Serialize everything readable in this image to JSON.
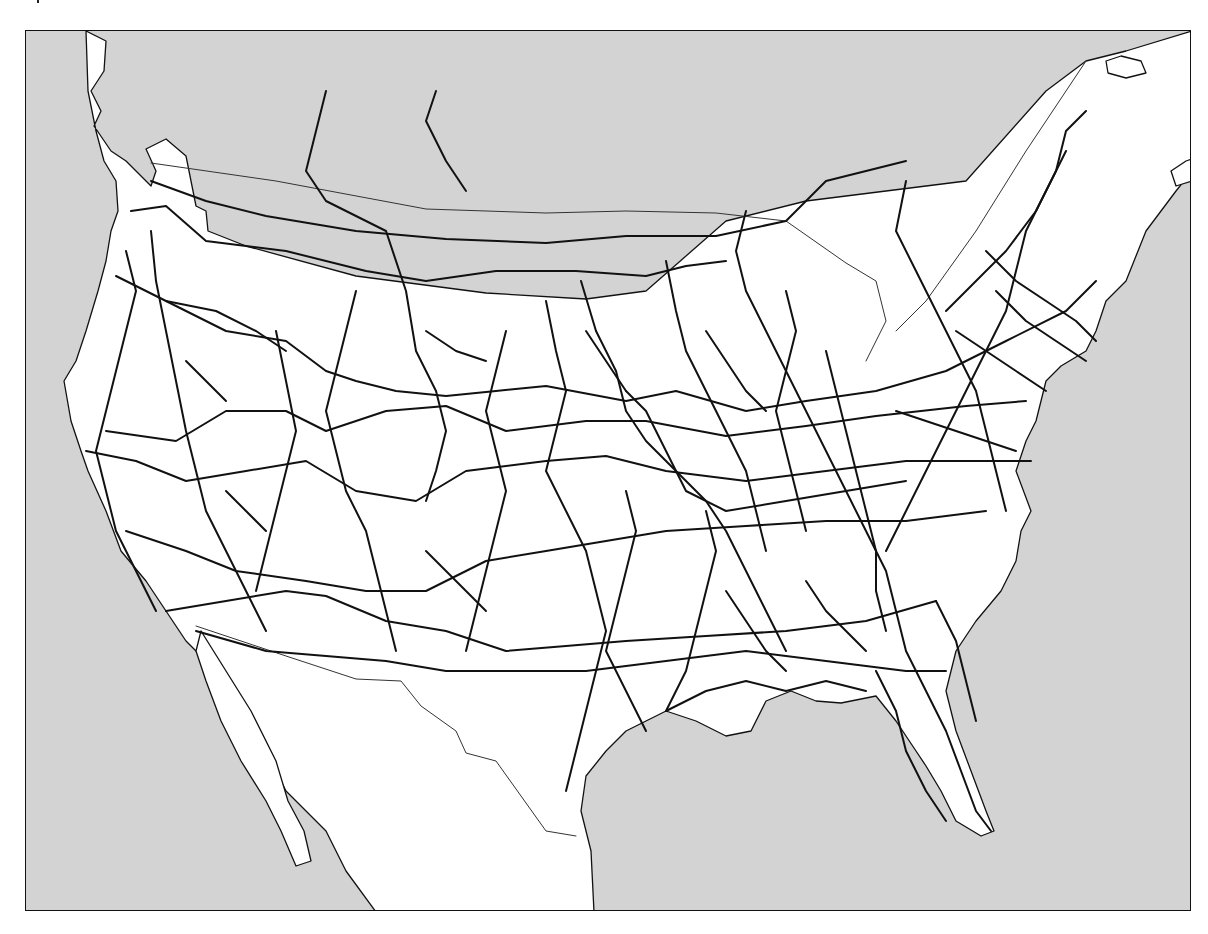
{
  "map": {
    "title": "",
    "colors": {
      "ocean": "#d3d3d3",
      "land": "#ffffff",
      "coastline": "#111111",
      "rail": "#111111",
      "border": "#333333",
      "frame": "#111111"
    },
    "stroke": {
      "coast": 1.3,
      "rail": 2.0,
      "border": 1.0
    },
    "land_paths": [
      "M60 0 L80 10 L78 40 L65 60 L75 80 L68 95 L85 120 L100 130 L125 155 L130 140 L120 118 L140 108 L160 125 L165 150 L170 175 L180 180 L182 200 L220 215 L330 245 L460 262 L560 268 L620 260 L700 190 L780 170 L860 160 L940 150 L1020 60 L1060 30 L1100 20 L1166 0 L1166 140 L1150 160 L1120 200 L1100 250 L1080 270 L1070 300 L1060 320 L1035 335 L1020 350 L1010 390 L1000 410 L990 440 L1005 480 L995 500 L990 530 L975 560 L950 590 L930 620 L920 660 L930 700 L945 740 L960 780 L968 800 L955 805 L930 790 L915 760 L900 735 L890 720 L870 690 L850 665 L815 672 L790 670 L765 660 L740 670 L725 700 L700 705 L670 690 L640 680 L620 690 L600 700 L580 720 L560 745 L555 780 L565 820 L568 881 L350 881 L320 840 L300 800 L260 760 L230 700 L210 670 L190 640 L160 610 L140 580 L120 550 L95 520 L80 480 L62 440 L55 420 L45 390 L38 350 L50 330 L60 300 L72 260 L80 230 L85 200 L92 180 L90 150 L78 130 L70 100 L62 60 Z",
      "M175 600 L200 640 L225 680 L250 730 L262 770 L278 800 L285 830 L270 835 L255 800 L240 770 L215 730 L195 690 L180 650 L170 620 Z"
    ],
    "island_paths": [
      "M1080 30 L1095 25 L1115 30 L1120 42 L1100 47 L1082 42 Z",
      "M1160 130 L1166 128 L1166 150 L1150 155 L1145 140 Z"
    ],
    "border_paths": [
      "M125 132 L250 150 L400 178 L520 182 L600 180 L690 182 L760 190 L820 232 L850 250 L860 290 L840 330",
      "M170 595 L260 625 L330 648 L375 650 L395 675 L430 700 L440 722 L470 730 L520 800 L550 805",
      "M1060 30 L1000 120 L950 200 L900 270 L870 300"
    ],
    "rail_paths": [
      "M125 150 L180 170 L240 185 L330 200 L420 208 L520 212 L600 205 L690 205 L760 190 L800 150 L880 130",
      "M105 180 L140 175 L180 210 L260 220 L340 240 L400 250 L470 240 L550 240 L620 245 L660 235 L700 230",
      "M90 245 L150 275 L200 300 L260 310 L300 340 L330 350 L370 360 L420 365 L470 360 L520 355 L600 370 L650 360 L720 380 L780 370 L850 360 L920 340 L980 310 L1040 280 L1070 250",
      "M80 400 L150 410 L200 380 L260 380 L300 400 L360 380 L420 375 L480 400 L560 390 L620 390 L700 405 L780 395 L850 385 L940 375 L1000 370",
      "M60 420 L110 430 L160 450 L220 440 L280 430 L330 460 L390 470 L440 440 L520 430 L580 425 L640 440 L720 450 L800 440 L880 430 L960 430 L1005 430",
      "M100 500 L160 520 L210 540 L280 550 L340 560 L400 560 L460 530 L520 520 L580 510 L640 500 L720 495 L800 490 L880 490 L960 480",
      "M140 580 L200 570 L260 560 L300 565 L360 590 L420 600 L480 620 L540 615 L600 610 L680 605 L760 600 L840 590 L910 570",
      "M170 600 L240 620 L300 625 L360 630 L420 640 L480 640 L560 640 L640 630 L720 620 L800 630 L880 640 L920 640",
      "M300 60 L290 100 L280 140 L300 170 L360 200 L380 260 L390 320 L410 360 L420 400 L410 440 L400 470",
      "M410 60 L400 90 L420 130 L440 160",
      "M555 250 L570 300 L590 340 L600 380 L620 410 L650 440 L680 470 L700 500 L720 540 L740 580 L760 620",
      "M640 230 L650 280 L660 320 L680 360 L700 400 L720 440 L730 480 L740 520",
      "M720 180 L710 220 L720 260 L740 300 L760 340 L780 380 L800 420 L820 460 L840 500 L860 540 L870 580 L880 620 L900 660 L920 700 L935 740 L950 780 L965 800",
      "M880 150 L870 200 L890 240 L910 280 L930 320 L950 360 L960 400 L970 440 L980 480",
      "M1040 120 L1020 160 L1000 200 L990 240 L980 280 L960 320 L940 360 L920 400 L900 440 L880 480 L860 520",
      "M1060 80 L1040 100 L1030 140 L1010 180 L980 220 L950 250 L920 280",
      "M100 220 L110 260 L100 300 L90 340 L80 380 L70 420 L80 460 L90 500 L110 540 L130 580",
      "M125 200 L130 250 L140 300 L150 350 L160 400 L170 440 L180 480 L200 520 L220 560 L240 600",
      "M250 300 L260 350 L270 400 L260 440 L250 480 L240 520 L230 560",
      "M330 260 L320 300 L310 340 L300 380 L310 420 L320 460 L340 500 L350 540 L360 580 L370 620",
      "M480 300 L470 340 L460 380 L470 420 L480 460 L470 500 L460 540 L450 580 L440 620",
      "M520 270 L530 320 L540 360 L530 400 L520 440 L540 480 L560 520 L570 560 L580 600 L570 640 L560 680 L550 720 L540 760",
      "M600 460 L610 500 L600 540 L590 580 L580 620 L600 660 L620 700",
      "M680 480 L690 520 L680 560 L670 600 L660 640 L640 680",
      "M800 320 L810 360 L820 400 L830 440 L840 480 L850 520 L850 560 L860 600",
      "M760 260 L770 300 L760 340 L750 380 L760 420 L770 460 L780 500",
      "M600 360 L620 380 L640 420 L660 460 L700 480 L760 470 L820 460 L880 450",
      "M850 640 L870 680 L880 720 L900 760 L920 790",
      "M910 570 L930 610 L940 650 L950 690",
      "M640 680 L680 660 L720 650 L760 660 L800 650 L840 660",
      "M140 270 L190 280 L230 300 L260 320",
      "M400 300 L430 320 L460 330",
      "M560 300 L580 330 L600 360",
      "M680 300 L700 330 L720 360 L740 380",
      "M960 220 L990 250 L1020 270 L1050 290 L1070 310",
      "M970 260 L1000 290 L1030 310 L1060 330",
      "M930 300 L960 320 L990 340 L1020 360",
      "M870 380 L900 390 L930 400 L960 410 L990 420",
      "M780 550 L800 580 L820 600 L840 620",
      "M700 560 L720 590 L740 620 L760 640",
      "M400 520 L420 540 L440 560 L460 580",
      "M200 460 L220 480 L240 500",
      "M160 330 L180 350 L200 370"
    ]
  }
}
